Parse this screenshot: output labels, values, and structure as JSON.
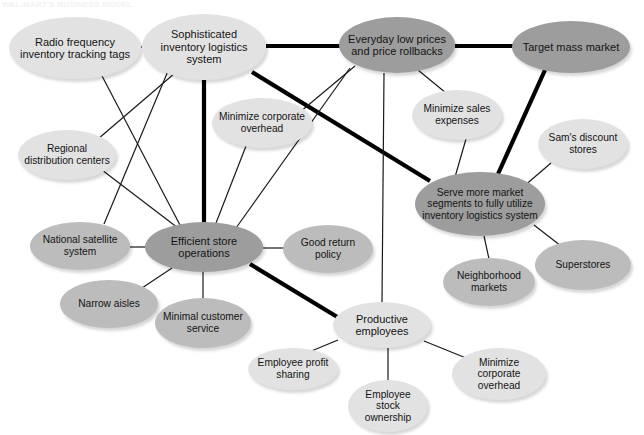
{
  "page": {
    "title_strip": "WAL-MART'S BUSINESS MODEL",
    "width": 644,
    "height": 435,
    "background": "#ffffff"
  },
  "diagram": {
    "type": "concept-network",
    "palette": {
      "node_dark": "#9d9d9d",
      "node_mid": "#bcbcbc",
      "node_light": "#e2e2e2",
      "edge_thin": "#1a1a1a",
      "edge_thick": "#000000",
      "text": "#141414"
    },
    "nodes": [
      {
        "id": "radio_tags",
        "label": "Radio frequency inventory tracking tags",
        "tone": "light",
        "cx": 75,
        "cy": 48,
        "rx": 66,
        "ry": 31,
        "font": "fs-11"
      },
      {
        "id": "sophisticated",
        "label": "Sophisticated inventory logistics system",
        "tone": "light",
        "cx": 204,
        "cy": 47,
        "rx": 62,
        "ry": 33,
        "font": "fs-11"
      },
      {
        "id": "everyday_low",
        "label": "Everyday low prices and price rollbacks",
        "tone": "dark",
        "cx": 397,
        "cy": 45,
        "rx": 58,
        "ry": 28,
        "font": "fs-11"
      },
      {
        "id": "target_mass",
        "label": "Target mass market",
        "tone": "dark",
        "cx": 571,
        "cy": 47,
        "rx": 59,
        "ry": 26,
        "font": "fs-11"
      },
      {
        "id": "min_corp_top",
        "label": "Minimize corporate overhead",
        "tone": "light",
        "cx": 262,
        "cy": 123,
        "rx": 50,
        "ry": 25,
        "font": "fs-10"
      },
      {
        "id": "min_sales",
        "label": "Minimize sales expenses",
        "tone": "light",
        "cx": 457,
        "cy": 115,
        "rx": 45,
        "ry": 25,
        "font": "fs-10"
      },
      {
        "id": "sams",
        "label": "Sam's discount stores",
        "tone": "light",
        "cx": 583,
        "cy": 144,
        "rx": 45,
        "ry": 25,
        "font": "fs-10"
      },
      {
        "id": "regional",
        "label": "Regional distribution centers",
        "tone": "light",
        "cx": 67,
        "cy": 155,
        "rx": 49,
        "ry": 25,
        "font": "fs-10"
      },
      {
        "id": "serve_more",
        "label": "Serve more market segments to fully utilize inventory logistics system",
        "tone": "dark",
        "cx": 480,
        "cy": 204,
        "rx": 65,
        "ry": 32,
        "font": "fs-10"
      },
      {
        "id": "national_sat",
        "label": "National satellite system",
        "tone": "mid",
        "cx": 80,
        "cy": 246,
        "rx": 50,
        "ry": 24,
        "font": "fs-10"
      },
      {
        "id": "efficient_store",
        "label": "Efficient store operations",
        "tone": "dark",
        "cx": 204,
        "cy": 247,
        "rx": 59,
        "ry": 25,
        "font": "fs-11"
      },
      {
        "id": "good_return",
        "label": "Good return policy",
        "tone": "mid",
        "cx": 328,
        "cy": 249,
        "rx": 45,
        "ry": 24,
        "font": "fs-10"
      },
      {
        "id": "superstores",
        "label": "Superstores",
        "tone": "mid",
        "cx": 583,
        "cy": 265,
        "rx": 48,
        "ry": 25,
        "font": "fs-10"
      },
      {
        "id": "neighborhood",
        "label": "Neighborhood markets",
        "tone": "mid",
        "cx": 489,
        "cy": 282,
        "rx": 46,
        "ry": 24,
        "font": "fs-10"
      },
      {
        "id": "narrow_aisles",
        "label": "Narrow aisles",
        "tone": "mid",
        "cx": 109,
        "cy": 304,
        "rx": 49,
        "ry": 24,
        "font": "fs-10"
      },
      {
        "id": "minimal_cust",
        "label": "Minimal customer service",
        "tone": "mid",
        "cx": 203,
        "cy": 323,
        "rx": 48,
        "ry": 25,
        "font": "fs-10"
      },
      {
        "id": "productive_emp",
        "label": "Productive employees",
        "tone": "light",
        "cx": 382,
        "cy": 325,
        "rx": 49,
        "ry": 23,
        "font": "fs-11"
      },
      {
        "id": "emp_profit",
        "label": "Employee profit sharing",
        "tone": "light",
        "cx": 293,
        "cy": 369,
        "rx": 45,
        "ry": 21,
        "font": "fs-10"
      },
      {
        "id": "min_corp_bottom",
        "label": "Minimize corporate overhead",
        "tone": "light",
        "cx": 499,
        "cy": 374,
        "rx": 47,
        "ry": 26,
        "font": "fs-10"
      },
      {
        "id": "emp_stock",
        "label": "Employee stock ownership",
        "tone": "light",
        "cx": 388,
        "cy": 406,
        "rx": 40,
        "ry": 26,
        "font": "fs-10"
      }
    ],
    "edges": [
      {
        "from": "radio_tags",
        "to": "sophisticated",
        "weight": "thin",
        "x1": 141,
        "y1": 47,
        "x2": 168,
        "y2": 47
      },
      {
        "from": "radio_tags",
        "to": "efficient_store",
        "weight": "thin",
        "x1": 101,
        "y1": 74,
        "x2": 180,
        "y2": 225
      },
      {
        "from": "sophisticated",
        "to": "everyday_low",
        "weight": "thick",
        "x1": 266,
        "y1": 46,
        "x2": 340,
        "y2": 46
      },
      {
        "from": "sophisticated",
        "to": "efficient_store",
        "weight": "thick",
        "x1": 204,
        "y1": 80,
        "x2": 204,
        "y2": 223
      },
      {
        "from": "sophisticated",
        "to": "regional",
        "weight": "thin",
        "x1": 175,
        "y1": 73,
        "x2": 98,
        "y2": 139
      },
      {
        "from": "sophisticated",
        "to": "national_sat",
        "weight": "thin",
        "x1": 168,
        "y1": 71,
        "x2": 104,
        "y2": 224
      },
      {
        "from": "sophisticated",
        "to": "serve_more",
        "weight": "thick",
        "x1": 252,
        "y1": 72,
        "x2": 430,
        "y2": 181
      },
      {
        "from": "everyday_low",
        "to": "target_mass",
        "weight": "thick",
        "x1": 455,
        "y1": 46,
        "x2": 513,
        "y2": 46
      },
      {
        "from": "everyday_low",
        "to": "min_sales",
        "weight": "thin",
        "x1": 418,
        "y1": 70,
        "x2": 446,
        "y2": 93
      },
      {
        "from": "everyday_low",
        "to": "productive_emp",
        "weight": "thin",
        "x1": 384,
        "y1": 73,
        "x2": 382,
        "y2": 302
      },
      {
        "from": "everyday_low",
        "to": "min_corp_top",
        "weight": "thin",
        "x1": 355,
        "y1": 66,
        "x2": 300,
        "y2": 112
      },
      {
        "from": "everyday_low",
        "to": "efficient_store",
        "weight": "thin",
        "x1": 350,
        "y1": 68,
        "x2": 236,
        "y2": 228
      },
      {
        "from": "target_mass",
        "to": "serve_more",
        "weight": "thick",
        "x1": 545,
        "y1": 70,
        "x2": 498,
        "y2": 174
      },
      {
        "from": "min_corp_top",
        "to": "efficient_store",
        "weight": "thin",
        "x1": 246,
        "y1": 146,
        "x2": 216,
        "y2": 223
      },
      {
        "from": "min_sales",
        "to": "serve_more",
        "weight": "thin",
        "x1": 466,
        "y1": 139,
        "x2": 455,
        "y2": 177
      },
      {
        "from": "sams",
        "to": "serve_more",
        "weight": "thin",
        "x1": 551,
        "y1": 163,
        "x2": 523,
        "y2": 187
      },
      {
        "from": "regional",
        "to": "efficient_store",
        "weight": "thin",
        "x1": 102,
        "y1": 170,
        "x2": 178,
        "y2": 228
      },
      {
        "from": "serve_more",
        "to": "superstores",
        "weight": "thin",
        "x1": 534,
        "y1": 225,
        "x2": 561,
        "y2": 246
      },
      {
        "from": "serve_more",
        "to": "neighborhood",
        "weight": "thin",
        "x1": 484,
        "y1": 236,
        "x2": 489,
        "y2": 259
      },
      {
        "from": "national_sat",
        "to": "efficient_store",
        "weight": "thin",
        "x1": 130,
        "y1": 247,
        "x2": 146,
        "y2": 247
      },
      {
        "from": "efficient_store",
        "to": "good_return",
        "weight": "thin",
        "x1": 263,
        "y1": 248,
        "x2": 284,
        "y2": 248
      },
      {
        "from": "efficient_store",
        "to": "narrow_aisles",
        "weight": "thin",
        "x1": 172,
        "y1": 268,
        "x2": 142,
        "y2": 288
      },
      {
        "from": "efficient_store",
        "to": "minimal_cust",
        "weight": "thin",
        "x1": 203,
        "y1": 272,
        "x2": 203,
        "y2": 299
      },
      {
        "from": "efficient_store",
        "to": "productive_emp",
        "weight": "thick",
        "x1": 250,
        "y1": 264,
        "x2": 339,
        "y2": 318
      },
      {
        "from": "productive_emp",
        "to": "emp_profit",
        "weight": "thin",
        "x1": 338,
        "y1": 340,
        "x2": 309,
        "y2": 352
      },
      {
        "from": "productive_emp",
        "to": "emp_stock",
        "weight": "thin",
        "x1": 388,
        "y1": 348,
        "x2": 388,
        "y2": 381
      },
      {
        "from": "productive_emp",
        "to": "min_corp_bottom",
        "weight": "thin",
        "x1": 424,
        "y1": 341,
        "x2": 466,
        "y2": 358
      }
    ]
  }
}
